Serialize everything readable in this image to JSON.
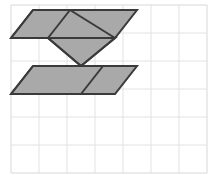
{
  "canvas": {
    "width": 219,
    "height": 175,
    "background": "#ffffff",
    "title": "Grid with shaded geometric tangram figure"
  },
  "grid": {
    "label": "square-grid",
    "origin_x": 11,
    "origin_y": 5,
    "cell_size": 28,
    "columns": 7,
    "rows": 6,
    "line_color": "#e2e2e2",
    "border_color": "#d8d8d8",
    "line_width": 1,
    "visible": true
  },
  "figure": {
    "name": "shaded-polygon-figure",
    "fill_color": "#a9a9a9",
    "stroke_color": "#3a3a3a",
    "stroke_width": 2,
    "inner_line_color": "#3a3a3a",
    "inner_line_width": 2,
    "pieces": [
      {
        "name": "top-parallelogram",
        "type": "parallelogram",
        "points": "33,10 137,10 115,38 11,38"
      },
      {
        "name": "middle-downward-triangle",
        "type": "triangle",
        "points": "48,38 115,38 81,66"
      },
      {
        "name": "bottom-parallelogram",
        "type": "parallelogram",
        "points": "33,66 137,66 115,94 11,94"
      }
    ],
    "inner_segments": [
      {
        "name": "top-left-diagonal",
        "x1": 33,
        "y1": 10,
        "x2": 11,
        "y2": 38
      },
      {
        "name": "top-mid-diagonal",
        "x1": 70,
        "y1": 10,
        "x2": 48,
        "y2": 38
      },
      {
        "name": "top-right-antidiagonal",
        "x1": 70,
        "y1": 10,
        "x2": 115,
        "y2": 38
      },
      {
        "name": "notch-left-edge",
        "x1": 48,
        "y1": 38,
        "x2": 81,
        "y2": 66
      },
      {
        "name": "notch-right-edge",
        "x1": 115,
        "y1": 38,
        "x2": 81,
        "y2": 66
      },
      {
        "name": "bottom-mid-diagonal",
        "x1": 103,
        "y1": 66,
        "x2": 81,
        "y2": 94
      },
      {
        "name": "bottom-left-diagonal",
        "x1": 33,
        "y1": 66,
        "x2": 11,
        "y2": 94
      }
    ]
  }
}
